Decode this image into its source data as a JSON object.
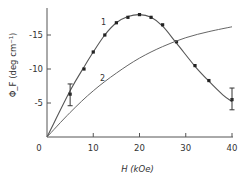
{
  "chart_data": {
    "type": "line",
    "title": "",
    "xlabel": "H (kOe)",
    "ylabel": "Φ_F (deg cm⁻¹)",
    "xlim": [
      0,
      40
    ],
    "ylim": [
      0,
      -19
    ],
    "xticks": [
      0,
      10,
      20,
      30,
      40
    ],
    "xtick_labels": [
      "0",
      "10",
      "20",
      "30",
      "40"
    ],
    "yticks": [
      -5,
      -10,
      -15
    ],
    "ytick_labels": [
      "-5",
      "-10",
      "-15"
    ],
    "grid": false,
    "legend": null,
    "series": [
      {
        "name": "1",
        "kind": "fit-curve-with-points",
        "curve": {
          "x": [
            0,
            5,
            8,
            10,
            12.5,
            15,
            17.5,
            20,
            22.5,
            25,
            28,
            32,
            35,
            38,
            40
          ],
          "y": [
            0,
            -6.8,
            -10.3,
            -12.5,
            -15.0,
            -16.8,
            -17.7,
            -18.0,
            -17.6,
            -16.3,
            -13.8,
            -10.4,
            -8.2,
            -6.2,
            -5.2
          ]
        },
        "points": {
          "x": [
            5,
            8,
            10,
            12.5,
            15,
            17.5,
            20,
            22.5,
            25,
            28,
            32,
            35,
            40
          ],
          "y": [
            -6.3,
            -10.0,
            -12.5,
            -15.0,
            -16.8,
            -17.6,
            -18.0,
            -17.6,
            -16.5,
            -14.0,
            -10.5,
            -8.3,
            -5.5
          ]
        },
        "error_bars": [
          {
            "x": 5,
            "y": -6.3,
            "low": -4.6,
            "high": -7.8
          },
          {
            "x": 40,
            "y": -5.5,
            "low": -4.0,
            "high": -7.2
          }
        ]
      },
      {
        "name": "2",
        "kind": "curve",
        "x": [
          0,
          5,
          10,
          15,
          20,
          25,
          30,
          35,
          40
        ],
        "y": [
          0,
          -3.6,
          -6.8,
          -9.4,
          -11.6,
          -13.3,
          -14.6,
          -15.5,
          -16.2
        ]
      }
    ],
    "curve_labels": [
      {
        "text": "1",
        "x": 12.2,
        "y": -16.5
      },
      {
        "text": "2",
        "x": 12.0,
        "y": -8.2
      }
    ]
  }
}
